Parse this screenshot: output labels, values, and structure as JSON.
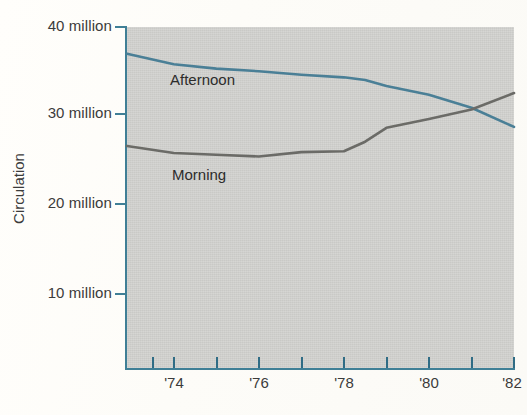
{
  "chart_data": {
    "type": "line",
    "title": "",
    "xlabel": "",
    "ylabel": "Circulation",
    "xlim": [
      1972.9,
      1982.0
    ],
    "ylim": [
      0,
      40
    ],
    "grid": false,
    "legend_position": "inline-labels",
    "y_ticks": [
      {
        "value": 40,
        "label": "40 million"
      },
      {
        "value": 30,
        "label": "30 million"
      },
      {
        "value": 20,
        "label": "20 million"
      },
      {
        "value": 10,
        "label": "10 million"
      }
    ],
    "x_ticks": [
      {
        "value": 1973.5,
        "label": ""
      },
      {
        "value": 1974,
        "label": "'74"
      },
      {
        "value": 1975,
        "label": ""
      },
      {
        "value": 1976,
        "label": "'76"
      },
      {
        "value": 1977,
        "label": ""
      },
      {
        "value": 1978,
        "label": "'78"
      },
      {
        "value": 1979,
        "label": ""
      },
      {
        "value": 1980,
        "label": "'80"
      },
      {
        "value": 1981,
        "label": ""
      },
      {
        "value": 1982,
        "label": "'82"
      }
    ],
    "x": [
      1972.9,
      1974,
      1975,
      1976,
      1977,
      1978,
      1978.5,
      1979,
      1980,
      1981,
      1982
    ],
    "series": [
      {
        "name": "Afternoon",
        "color": "#4a7f96",
        "values": [
          36.8,
          35.6,
          35.1,
          34.8,
          34.4,
          34.1,
          33.8,
          33.1,
          32.1,
          30.6,
          28.4
        ]
      },
      {
        "name": "Morning",
        "color": "#6b6b67",
        "values": [
          26.2,
          25.4,
          25.2,
          25.0,
          25.5,
          25.6,
          26.7,
          28.3,
          29.3,
          30.4,
          32.3
        ]
      }
    ],
    "annotations": [
      {
        "text": "Afternoon",
        "x": 1975.0,
        "y": 33.5
      },
      {
        "text": "Morning",
        "x": 1975.1,
        "y": 22.9
      }
    ]
  },
  "axis": {
    "y_title": "Circulation",
    "y_tick_labels": [
      "40 million",
      "30 million",
      "20 million",
      "10 million"
    ],
    "x_tick_labels": [
      "'74",
      "'76",
      "'78",
      "'80",
      "'82"
    ]
  },
  "colors": {
    "plot_background": "#c9c9c6",
    "axis": "#3f7f96",
    "afternoon_line": "#4a7f96",
    "morning_line": "#6b6b67",
    "page_background": "#fdfdfb",
    "text": "#3b3b3b"
  }
}
